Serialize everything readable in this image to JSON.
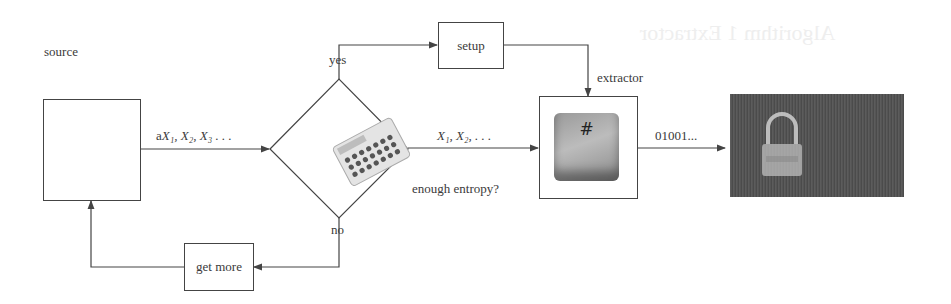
{
  "diagram": {
    "type": "flowchart",
    "nodes": {
      "source": {
        "label": "source"
      },
      "decision": {
        "label": "enough entropy?",
        "image": "calculator-image"
      },
      "setup": {
        "label": "setup"
      },
      "extractor": {
        "label": "extractor",
        "image": "hash-key-image",
        "key_glyph": "#"
      },
      "output": {
        "image": "padlock-binary-image"
      },
      "get_more": {
        "label": "get more"
      }
    },
    "edges": {
      "source_to_decision": {
        "label_prefix": "a",
        "label_math": "X₁, X₂, X₃ . . ."
      },
      "decision_to_extractor": {
        "label_math": "X₁, X₂, . . ."
      },
      "decision_yes": {
        "label": "yes"
      },
      "decision_no": {
        "label": "no"
      },
      "extractor_to_output": {
        "label": "01001..."
      }
    }
  },
  "colors": {
    "line": "#444444",
    "text": "#3a3a3a",
    "background": "#ffffff"
  }
}
